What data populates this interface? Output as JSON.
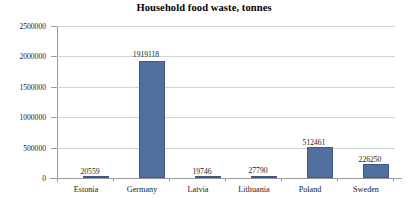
{
  "chart_data": {
    "type": "bar",
    "title": "Household food waste, tonnes",
    "xlabel": "",
    "ylabel": "",
    "categories": [
      "Estonia",
      "Germany",
      "Latvia",
      "Lithuania",
      "Poland",
      "Sweden"
    ],
    "values": [
      20559,
      1919118,
      19746,
      27790,
      512461,
      226250
    ],
    "data_labels": [
      "20559",
      "1919118",
      "19746",
      "27790",
      "512461",
      "226250"
    ],
    "ylim": [
      0,
      2500000
    ],
    "yticks": [
      0,
      500000,
      1000000,
      1500000,
      2000000,
      2500000
    ],
    "ytick_labels": [
      "0",
      "500000",
      "1000000",
      "1500000",
      "2000000",
      "2500000"
    ],
    "grid": true,
    "legend": false,
    "series": [
      {
        "name": "Household food waste, tonnes",
        "values": [
          20559,
          1919118,
          19746,
          27790,
          512461,
          226250
        ]
      }
    ],
    "colors": {
      "bar_fill": "#50709f",
      "bar_border": "#3c5a86",
      "gridline": "#d2d2d2",
      "axis": "#9a9a9a",
      "text": "#1a1a1a",
      "background": "#ffffff"
    }
  }
}
